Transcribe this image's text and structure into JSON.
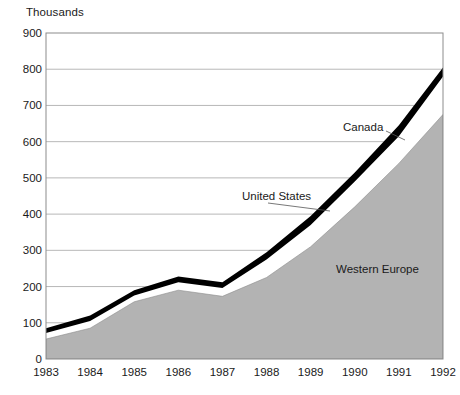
{
  "chart_data": {
    "type": "area",
    "title": "",
    "subtitle": "",
    "unit_label": "Thousands",
    "xlabel": "",
    "ylabel": "",
    "categories": [
      "1983",
      "1984",
      "1985",
      "1986",
      "1987",
      "1988",
      "1989",
      "1990",
      "1991",
      "1992"
    ],
    "x": [
      1983,
      1984,
      1985,
      1986,
      1987,
      1988,
      1989,
      1990,
      1991,
      1992
    ],
    "ylim": [
      0,
      900
    ],
    "ytick_values": [
      0,
      100,
      200,
      300,
      400,
      500,
      600,
      700,
      800,
      900
    ],
    "ytick_labels": [
      "0",
      "100",
      "200",
      "300",
      "400",
      "500",
      "600",
      "700",
      "800",
      "900"
    ],
    "grid": true,
    "grid_axis": "y",
    "legend_position": "inline-annotations",
    "stacked": true,
    "stack_order_bottom_to_top": [
      "Western Europe",
      "United States",
      "Canada"
    ],
    "series": [
      {
        "name": "Western Europe",
        "color": "#b3b3b3",
        "values": [
          55,
          85,
          158,
          190,
          173,
          225,
          310,
          420,
          540,
          675
        ]
      },
      {
        "name": "United States",
        "color": "#ffffff",
        "values": [
          17,
          20,
          17,
          22,
          23,
          50,
          60,
          70,
          75,
          105
        ]
      },
      {
        "name": "Canada",
        "color": "#000000",
        "values": [
          13,
          15,
          15,
          16,
          16,
          20,
          25,
          25,
          30,
          25
        ]
      }
    ],
    "cumulative_tops": {
      "Western Europe": [
        55,
        85,
        158,
        190,
        173,
        225,
        310,
        420,
        540,
        675
      ],
      "United States": [
        72,
        105,
        175,
        212,
        196,
        275,
        370,
        490,
        615,
        780
      ],
      "Canada": [
        85,
        120,
        190,
        228,
        212,
        295,
        395,
        515,
        645,
        805
      ]
    },
    "annotations": [
      {
        "text": "Canada",
        "series": "Canada"
      },
      {
        "text": "United States",
        "series": "United States"
      },
      {
        "text": "Western Europe",
        "series": "Western Europe"
      }
    ],
    "colors": {
      "western_europe": "#b3b3b3",
      "united_states": "#ffffff",
      "canada": "#000000",
      "gridline": "#9a9a9a",
      "frame": "#8c8c8c",
      "text": "#1a1a1a",
      "background": "#ffffff"
    }
  }
}
